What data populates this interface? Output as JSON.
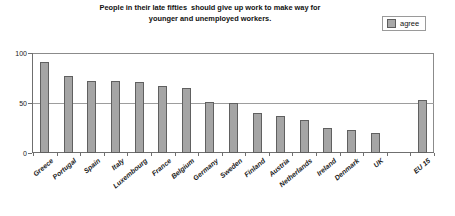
{
  "chart_title": {
    "line1": "People in their late fifties  should give up work to make way for",
    "line2": "younger and unemployed workers."
  },
  "legend": {
    "entries": [
      {
        "label": "agree",
        "color": "#a5a5a5"
      }
    ]
  },
  "axis": {
    "y_ticks": [
      "0",
      "50",
      "100"
    ]
  },
  "chart_data": {
    "type": "bar",
    "title": "People in their late fifties should give up work to make way for younger and unemployed workers.",
    "xlabel": "",
    "ylabel": "",
    "ylim": [
      0,
      100
    ],
    "yticks": [
      0,
      50,
      100
    ],
    "grid": true,
    "legend_position": "top-right",
    "series": [
      {
        "name": "agree",
        "color": "#a5a5a5",
        "values": [
          91,
          77,
          72,
          72,
          71,
          67,
          65,
          51,
          50,
          40,
          37,
          33,
          25,
          23,
          20,
          null,
          53
        ]
      }
    ],
    "categories": [
      "Greece",
      "Portugal",
      "Spain",
      "Italy",
      "Luxembourg",
      "France",
      "Belgium",
      "Germany",
      "Sweden",
      "Finland",
      "Austria",
      "Netherlands",
      "Ireland",
      "Denmark",
      "UK",
      "",
      "EU 15"
    ]
  }
}
